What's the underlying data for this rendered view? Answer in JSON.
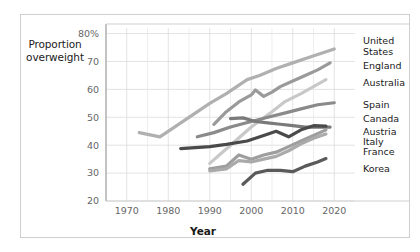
{
  "figure": {
    "y_axis_title_line1": "Proportion",
    "y_axis_title_line2": "overweight",
    "x_axis_title": "Year"
  },
  "chart_data": {
    "type": "line",
    "title": "",
    "xlabel": "Year",
    "ylabel": "Proportion overweight",
    "xlim": [
      1965,
      2025
    ],
    "ylim": [
      20,
      82
    ],
    "xticks": [
      1970,
      1980,
      1990,
      2000,
      2010,
      2020
    ],
    "xtick_labels": [
      "1970",
      "1980",
      "1990",
      "2000",
      "2010",
      "2020"
    ],
    "yticks": [
      20,
      30,
      40,
      50,
      60,
      70,
      80
    ],
    "ytick_labels": [
      "20",
      "30",
      "40",
      "50",
      "60",
      "70",
      "80%"
    ],
    "grid": true,
    "legend_position": "right-outside",
    "units": "percent",
    "series": [
      {
        "name": "United States",
        "color": "#b0b0b0",
        "label_color": "#1a1a1a",
        "x": [
          1973,
          1978,
          1990,
          1994,
          1999,
          2002,
          2006,
          2010,
          2014,
          2018,
          2020
        ],
        "values": [
          44.5,
          43.0,
          55.0,
          58.5,
          63.5,
          65.0,
          67.5,
          69.5,
          71.5,
          73.5,
          74.5
        ]
      },
      {
        "name": "England",
        "color": "#9a9a9a",
        "label_color": "#1a1a1a",
        "x": [
          1991,
          1994,
          1997,
          2000,
          2001,
          2003,
          2005,
          2007,
          2010,
          2013,
          2016,
          2019
        ],
        "values": [
          47.5,
          52.0,
          55.5,
          58.0,
          59.8,
          57.5,
          59.0,
          61.0,
          63.0,
          65.0,
          67.0,
          69.5
        ]
      },
      {
        "name": "Australia",
        "color": "#c8c8c8",
        "label_color": "#1a1a1a",
        "x": [
          1990,
          1995,
          2000,
          2005,
          2008,
          2012,
          2015,
          2018
        ],
        "values": [
          33.5,
          40.0,
          46.5,
          52.0,
          55.5,
          58.5,
          61.0,
          63.5
        ]
      },
      {
        "name": "Spain",
        "color": "#8a8a8a",
        "label_color": "#1a1a1a",
        "x": [
          1987,
          1991,
          1995,
          2000,
          2004,
          2008,
          2012,
          2016,
          2020
        ],
        "values": [
          43.0,
          44.5,
          46.5,
          48.5,
          50.0,
          51.5,
          53.0,
          54.5,
          55.2
        ]
      },
      {
        "name": "Canada",
        "color": "#7a7a7a",
        "label_color": "#1a1a1a",
        "x": [
          1995,
          1998,
          2001,
          2004,
          2007,
          2010,
          2013,
          2016,
          2019
        ],
        "values": [
          49.5,
          49.8,
          48.5,
          48.0,
          47.5,
          47.0,
          46.5,
          46.5,
          46.5
        ]
      },
      {
        "name": "Austria",
        "color": "#4a4a4a",
        "label_color": "#1a1a1a",
        "x": [
          1983,
          1990,
          1994,
          1999,
          2003,
          2006,
          2009,
          2012,
          2015,
          2018
        ],
        "values": [
          38.8,
          39.5,
          40.3,
          41.5,
          43.5,
          45.0,
          43.0,
          45.5,
          47.0,
          46.8
        ]
      },
      {
        "name": "Italy",
        "color": "#9e9e9e",
        "label_color": "#1a1a1a",
        "x": [
          1990,
          1994,
          1997,
          2000,
          2003,
          2006,
          2009,
          2012,
          2015,
          2018
        ],
        "values": [
          31.5,
          32.5,
          36.5,
          35.0,
          36.5,
          37.5,
          39.5,
          41.5,
          43.5,
          45.5
        ]
      },
      {
        "name": "France",
        "color": "#aaaaaa",
        "label_color": "#1a1a1a",
        "x": [
          1990,
          1994,
          1997,
          2000,
          2003,
          2006,
          2009,
          2012,
          2015,
          2018
        ],
        "values": [
          30.8,
          31.5,
          34.5,
          34.0,
          35.0,
          36.0,
          38.0,
          40.5,
          42.5,
          44.0
        ]
      },
      {
        "name": "Korea",
        "color": "#5a5a5a",
        "label_color": "#1a1a1a",
        "x": [
          1998,
          2001,
          2004,
          2007,
          2010,
          2013,
          2016,
          2018
        ],
        "values": [
          26.0,
          30.0,
          31.0,
          31.0,
          30.5,
          32.5,
          34.0,
          35.2
        ]
      }
    ]
  },
  "legend": {
    "entries": [
      {
        "label": "United States",
        "two_line": true,
        "line1": "United",
        "line2": "States",
        "y": 36
      },
      {
        "label": "England",
        "two_line": false,
        "line1": "England",
        "line2": "",
        "y": 61
      },
      {
        "label": "Australia",
        "two_line": false,
        "line1": "Australia",
        "line2": "",
        "y": 78
      },
      {
        "label": "Spain",
        "two_line": false,
        "line1": "Spain",
        "line2": "",
        "y": 100
      },
      {
        "label": "Canada",
        "two_line": false,
        "line1": "Canada",
        "line2": "",
        "y": 114
      },
      {
        "label": "Austria",
        "two_line": false,
        "line1": "Austria",
        "line2": "",
        "y": 127
      },
      {
        "label": "Italy",
        "two_line": false,
        "line1": "Italy",
        "line2": "",
        "y": 137
      },
      {
        "label": "France",
        "two_line": false,
        "line1": "France",
        "line2": "",
        "y": 147
      },
      {
        "label": "Korea",
        "two_line": false,
        "line1": "Korea",
        "line2": "",
        "y": 164
      }
    ]
  }
}
